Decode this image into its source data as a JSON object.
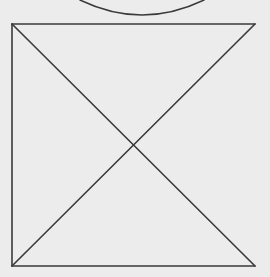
{
  "canvas": {
    "width": 270,
    "height": 277,
    "background": "#ececec"
  },
  "stroke": {
    "color": "#3a3a3a",
    "width": 1.6
  },
  "shapes": {
    "arc": {
      "start": [
        80,
        0
      ],
      "control": [
        142,
        30
      ],
      "end": [
        204,
        0
      ]
    },
    "frame": {
      "top": {
        "x1": 12,
        "y1": 24,
        "x2": 255,
        "y2": 24
      },
      "left": {
        "x1": 12,
        "y1": 24,
        "x2": 12,
        "y2": 266
      },
      "bottom": {
        "x1": 12,
        "y1": 266,
        "x2": 255,
        "y2": 266
      }
    },
    "diagonals": [
      {
        "x1": 12,
        "y1": 24,
        "x2": 255,
        "y2": 266
      },
      {
        "x1": 255,
        "y1": 24,
        "x2": 12,
        "y2": 266
      }
    ],
    "intersection": [
      133,
      145
    ]
  }
}
